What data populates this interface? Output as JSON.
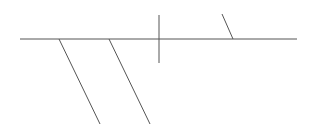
{
  "diagram": {
    "type": "line-skeleton",
    "width": 316,
    "height": 135,
    "background": "#ffffff",
    "stroke_color": "#555555",
    "stroke_width": 1,
    "spine": {
      "x1": 20,
      "y1": 39,
      "x2": 297,
      "y2": 39
    },
    "vertical_bar": {
      "x1": 159,
      "y1": 15,
      "x2": 159,
      "y2": 63
    },
    "branches": [
      {
        "id": "branch-1",
        "x1": 59,
        "y1": 39,
        "x2": 100,
        "y2": 124
      },
      {
        "id": "branch-2",
        "x1": 109,
        "y1": 39,
        "x2": 150,
        "y2": 124
      },
      {
        "id": "branch-3",
        "x1": 222,
        "y1": 14,
        "x2": 233,
        "y2": 39
      }
    ]
  }
}
